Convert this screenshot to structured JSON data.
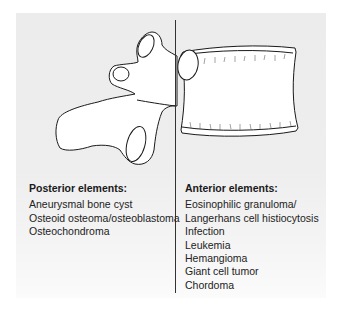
{
  "figure": {
    "posterior": {
      "title": "Posterior elements:",
      "items": [
        "Aneurysmal bone cyst",
        "Osteoid osteoma/osteoblastoma",
        "Osteochondroma"
      ]
    },
    "anterior": {
      "title": "Anterior elements:",
      "items": [
        "Eosinophilic granuloma/",
        "Langerhans cell histiocytosis",
        "Infection",
        "Leukemia",
        "Hemangioma",
        "Giant cell tumor",
        "Chordoma"
      ]
    },
    "colors": {
      "panel": "#ececec",
      "line": "#333333",
      "bone_fill": "#ffffff",
      "text": "#222222"
    }
  }
}
